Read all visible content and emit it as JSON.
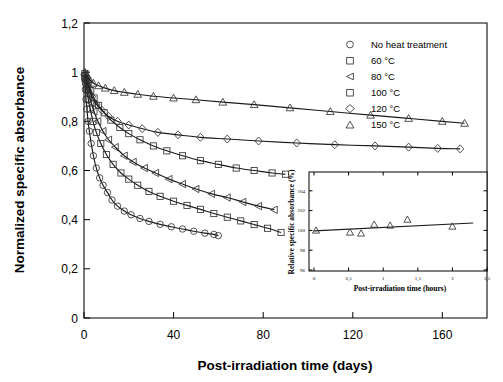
{
  "figure": {
    "background": "#ffffff",
    "line_color": "#1a1a1a",
    "marker_color": "#333333"
  },
  "chart_data": {
    "type": "scatter",
    "title": "",
    "xlabel": "Post-irradiation time (days)",
    "ylabel": "Normalized specific absorbance",
    "xlim": [
      0,
      180
    ],
    "ylim": [
      0,
      1.2
    ],
    "xticks": [
      0,
      40,
      80,
      120,
      160
    ],
    "xtick_labels": [
      "0",
      "40",
      "80",
      "120",
      "160"
    ],
    "yticks": [
      0,
      0.2,
      0.4,
      0.6,
      0.8,
      1.0,
      1.2
    ],
    "ytick_labels": [
      "0",
      "0,2",
      "0,4",
      "0,6",
      "0,8",
      "1",
      "1,2"
    ],
    "grid": false,
    "legend_position": "top-right",
    "decimal_separator": ",",
    "series": [
      {
        "name": "No heat treatment",
        "marker": "circle",
        "x": [
          0.3,
          0.6,
          0.9,
          1.3,
          1.8,
          2.4,
          3.2,
          4.2,
          5.5,
          7.0,
          8.5,
          10.5,
          12.5,
          15.0,
          18.0,
          21.0,
          25.0,
          29.0,
          34.0,
          39.0,
          44.0,
          49.0,
          54.0,
          58.0,
          60.0
        ],
        "y": [
          0.97,
          0.93,
          0.89,
          0.85,
          0.8,
          0.76,
          0.71,
          0.66,
          0.61,
          0.57,
          0.54,
          0.51,
          0.48,
          0.455,
          0.435,
          0.42,
          0.405,
          0.393,
          0.381,
          0.371,
          0.362,
          0.353,
          0.345,
          0.34,
          0.335
        ]
      },
      {
        "name": "60 °C",
        "marker": "square",
        "x": [
          0.3,
          0.7,
          1.2,
          1.9,
          2.8,
          4.0,
          5.5,
          7.5,
          10.0,
          13.0,
          16.5,
          20.0,
          24.0,
          29.0,
          34.0,
          40.0,
          46.0,
          52.0,
          58.0,
          64.0,
          70.0,
          76.0,
          82.0,
          88.0
        ],
        "y": [
          0.985,
          0.96,
          0.93,
          0.89,
          0.85,
          0.8,
          0.755,
          0.71,
          0.665,
          0.625,
          0.59,
          0.565,
          0.54,
          0.515,
          0.495,
          0.475,
          0.458,
          0.442,
          0.425,
          0.41,
          0.395,
          0.38,
          0.365,
          0.348
        ]
      },
      {
        "name": "80 °C",
        "marker": "left-triangle",
        "x": [
          0.3,
          0.8,
          1.4,
          2.2,
          3.2,
          4.5,
          6.2,
          8.5,
          11.0,
          14.0,
          18.0,
          22.0,
          27.0,
          32.0,
          38.0,
          44.0,
          50.0,
          57.0,
          64.0,
          71.0,
          78.0,
          85.0
        ],
        "y": [
          0.99,
          0.965,
          0.94,
          0.91,
          0.875,
          0.84,
          0.8,
          0.76,
          0.725,
          0.695,
          0.66,
          0.635,
          0.61,
          0.59,
          0.565,
          0.545,
          0.525,
          0.505,
          0.49,
          0.472,
          0.455,
          0.44
        ]
      },
      {
        "name": "100 °C",
        "marker": "square",
        "x": [
          0.4,
          1.0,
          1.8,
          3.0,
          4.5,
          6.5,
          9.0,
          12.0,
          16.0,
          20.0,
          25.0,
          31.0,
          37.0,
          44.0,
          52.0,
          60.0,
          68.0,
          76.0,
          84.0,
          90.0
        ],
        "y": [
          0.995,
          0.975,
          0.955,
          0.925,
          0.895,
          0.865,
          0.835,
          0.805,
          0.775,
          0.75,
          0.725,
          0.7,
          0.68,
          0.66,
          0.64,
          0.625,
          0.61,
          0.6,
          0.59,
          0.585
        ]
      },
      {
        "name": "120 °C",
        "marker": "diamond",
        "x": [
          0.4,
          1.2,
          2.2,
          3.6,
          5.5,
          8.0,
          11.0,
          15.0,
          20.0,
          26.0,
          33.0,
          42.0,
          52.0,
          64.0,
          78.0,
          95.0,
          112.0,
          130.0,
          145.0,
          158.0,
          168.0
        ],
        "y": [
          0.99,
          0.96,
          0.935,
          0.9,
          0.87,
          0.845,
          0.82,
          0.8,
          0.785,
          0.77,
          0.755,
          0.745,
          0.735,
          0.728,
          0.72,
          0.712,
          0.705,
          0.7,
          0.695,
          0.69,
          0.688
        ]
      },
      {
        "name": "150 °C",
        "marker": "triangle",
        "x": [
          0.4,
          1.3,
          2.5,
          4.2,
          6.5,
          9.5,
          13.5,
          18.0,
          24.0,
          31.0,
          40.0,
          50.0,
          62.0,
          76.0,
          92.0,
          110.0,
          128.0,
          145.0,
          160.0,
          170.0
        ],
        "y": [
          1.0,
          0.985,
          0.97,
          0.955,
          0.945,
          0.935,
          0.925,
          0.918,
          0.91,
          0.902,
          0.895,
          0.888,
          0.878,
          0.868,
          0.855,
          0.84,
          0.825,
          0.812,
          0.8,
          0.792
        ]
      }
    ]
  },
  "legend": {
    "items": [
      {
        "label": "No heat treatment",
        "marker": "circle"
      },
      {
        "label": "60 °C",
        "marker": "square"
      },
      {
        "label": "80 °C",
        "marker": "left-triangle"
      },
      {
        "label": "100 °C",
        "marker": "square"
      },
      {
        "label": "120 °C",
        "marker": "diamond"
      },
      {
        "label": "150 °C",
        "marker": "triangle"
      }
    ]
  },
  "inset_chart": {
    "type": "scatter",
    "xlabel": "Post-irradiation time (hours)",
    "ylabel": "Relative specific absorbance (%)",
    "xlim": [
      0,
      2.5
    ],
    "ylim": [
      95,
      105
    ],
    "xticks": [
      0,
      0.5,
      1,
      1.5,
      2,
      2.5
    ],
    "xtick_labels": [
      "0",
      "0,5",
      "1",
      "1,5",
      "2",
      "2,5"
    ],
    "yticks": [
      96,
      98,
      100,
      102,
      104
    ],
    "ytick_labels": [
      "96",
      "98",
      "100",
      "102",
      "104"
    ],
    "grid": false,
    "marker": "triangle",
    "points_x": [
      0.03,
      0.52,
      0.68,
      0.87,
      1.1,
      1.35,
      2.0
    ],
    "points_y": [
      100.0,
      99.8,
      99.7,
      100.6,
      100.5,
      101.1,
      100.4
    ],
    "trend_x": [
      0.0,
      2.3
    ],
    "trend_y": [
      99.95,
      100.75
    ]
  }
}
